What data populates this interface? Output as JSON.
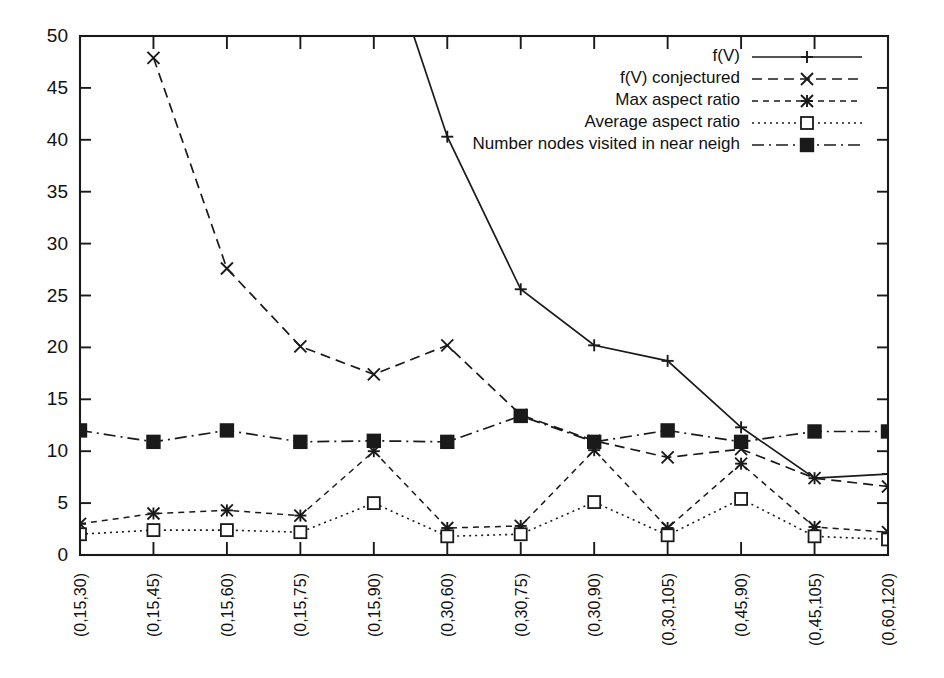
{
  "chart_data": {
    "type": "line",
    "title": "",
    "subtitle": "",
    "xlabel": "",
    "ylabel": "",
    "xlim": [
      0,
      11
    ],
    "ylim": [
      0,
      50
    ],
    "ytick_step": 5,
    "grid": false,
    "legend_position": "top-right",
    "categories": [
      "(0,15,30)",
      "(0,15,45)",
      "(0,15,60)",
      "(0,15,75)",
      "(0,15,90)",
      "(0,30,60)",
      "(0,30,75)",
      "(0,30,90)",
      "(0,30,105)",
      "(0,45,90)",
      "(0,45,105)",
      "(0,60,120)"
    ],
    "yticks": [
      0,
      5,
      10,
      15,
      20,
      25,
      30,
      35,
      40,
      45,
      50
    ],
    "series": [
      {
        "name": "f(V)",
        "marker": "plus",
        "dash": "solid",
        "values": [
          null,
          null,
          null,
          null,
          null,
          40.3,
          25.6,
          20.2,
          18.7,
          12.3,
          7.4,
          7.8
        ],
        "clipped_above": true
      },
      {
        "name": "f(V) conjectured",
        "marker": "cross",
        "dash": "dashed",
        "values": [
          null,
          47.9,
          27.6,
          20.1,
          17.4,
          20.2,
          13.5,
          11.0,
          9.4,
          10.2,
          7.4,
          6.6
        ]
      },
      {
        "name": "Max aspect ratio",
        "marker": "star",
        "dash": "dash-fine",
        "values": [
          3.0,
          4.0,
          4.3,
          3.8,
          10.0,
          2.6,
          2.8,
          10.1,
          2.6,
          8.8,
          2.7,
          2.2
        ]
      },
      {
        "name": "Average aspect ratio",
        "marker": "opensquare",
        "dash": "dotted",
        "values": [
          2.0,
          2.4,
          2.4,
          2.2,
          5.0,
          1.8,
          2.0,
          5.1,
          1.9,
          5.4,
          1.8,
          1.5
        ]
      },
      {
        "name": "Number nodes visited in near neigh",
        "marker": "filledsquare",
        "dash": "dashdot",
        "values": [
          12.0,
          10.9,
          12.0,
          10.9,
          11.0,
          10.9,
          13.4,
          10.9,
          12.0,
          10.9,
          11.9,
          11.9
        ]
      }
    ]
  },
  "legend": {
    "entries": [
      {
        "label": "f(V)"
      },
      {
        "label": "f(V) conjectured"
      },
      {
        "label": "Max aspect ratio"
      },
      {
        "label": "Average aspect ratio"
      },
      {
        "label": "Number nodes visited in near neigh"
      }
    ]
  },
  "colors": {
    "ink": "#1a1a1a",
    "background": "#ffffff"
  }
}
